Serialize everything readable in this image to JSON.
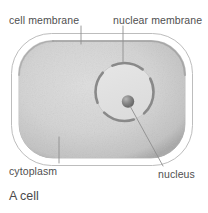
{
  "figure": {
    "caption": "A cell",
    "labels": [
      {
        "id": "cell-membrane",
        "text": "cell membrane"
      },
      {
        "id": "nuclear-membrane",
        "text": "nuclear membrane"
      },
      {
        "id": "cytoplasm",
        "text": "cytoplasm"
      },
      {
        "id": "nucleus",
        "text": "nucleus"
      }
    ],
    "parts": [
      {
        "id": "cell-membrane",
        "name": "cell membrane"
      },
      {
        "id": "cytoplasm",
        "name": "cytoplasm"
      },
      {
        "id": "nuclear-membrane",
        "name": "nuclear membrane"
      },
      {
        "id": "nucleus",
        "name": "nucleus"
      },
      {
        "id": "nucleolus",
        "name": "nucleolus"
      }
    ],
    "colors": {
      "background": "#ffffff",
      "membrane_outline": "#b9b9b9",
      "membrane_fill": "#ffffff",
      "cytoplasm_fill": "#d2d2d2",
      "cytoplasm_shade": "#a9a9a9",
      "nucleus_fill": "#e2e2e2",
      "nuclear_membrane": "#8c8c8c",
      "nucleolus": "#6f6f6f",
      "leader_line": "#8e8e8e",
      "text": "#4f4f4f"
    }
  }
}
